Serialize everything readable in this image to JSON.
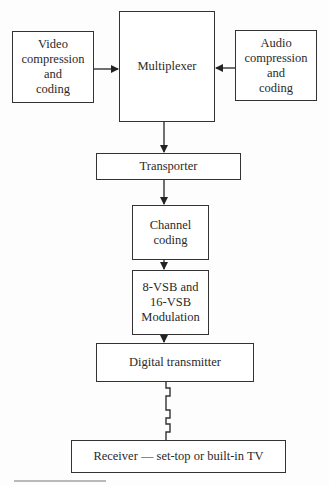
{
  "diagram": {
    "type": "block-flow",
    "nodes": {
      "video": {
        "label": "Video\ncompression\nand\ncoding"
      },
      "multiplexer": {
        "label": "Multiplexer"
      },
      "audio": {
        "label": "Audio\ncompression\nand\ncoding"
      },
      "transporter": {
        "label": "Transporter"
      },
      "channel": {
        "label": "Channel\ncoding"
      },
      "modulation": {
        "label": "8-VSB and\n16-VSB\nModulation"
      },
      "transmitter": {
        "label": "Digital transmitter"
      },
      "receiver": {
        "label": "Receiver — set-top or built-in TV"
      }
    },
    "edges": [
      {
        "from": "video",
        "to": "multiplexer",
        "style": "arrow"
      },
      {
        "from": "audio",
        "to": "multiplexer",
        "style": "arrow"
      },
      {
        "from": "multiplexer",
        "to": "transporter",
        "style": "arrow"
      },
      {
        "from": "transporter",
        "to": "channel",
        "style": "arrow"
      },
      {
        "from": "channel",
        "to": "modulation",
        "style": "arrow"
      },
      {
        "from": "modulation",
        "to": "transmitter",
        "style": "arrow"
      },
      {
        "from": "transmitter",
        "to": "receiver",
        "style": "wireless-zigzag"
      }
    ],
    "colors": {
      "line": "#333333",
      "background": "#ffffff"
    }
  }
}
